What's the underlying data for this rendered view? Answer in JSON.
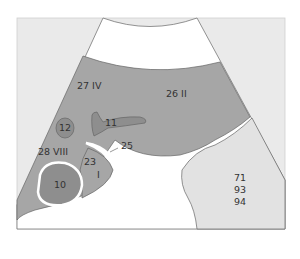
{
  "diagram": {
    "type": "ultrasound-schematic",
    "colors": {
      "frame_bg": "#eaeaea",
      "fan_bg": "#ffffff",
      "liver": "#a6a6a6",
      "structure_dark": "#8e8e8e",
      "right_region": "#e2e2e2",
      "outline": "#666666",
      "text": "#333333"
    },
    "labels": {
      "seg_iv": "27  IV",
      "seg_ii": "26  II",
      "s11": "11",
      "s12": "12",
      "s25": "25",
      "seg_viii": "28  VIII",
      "s23": "23",
      "seg_i": "I",
      "s10": "10",
      "right_1": "71",
      "right_2": "93",
      "right_3": "94"
    }
  }
}
